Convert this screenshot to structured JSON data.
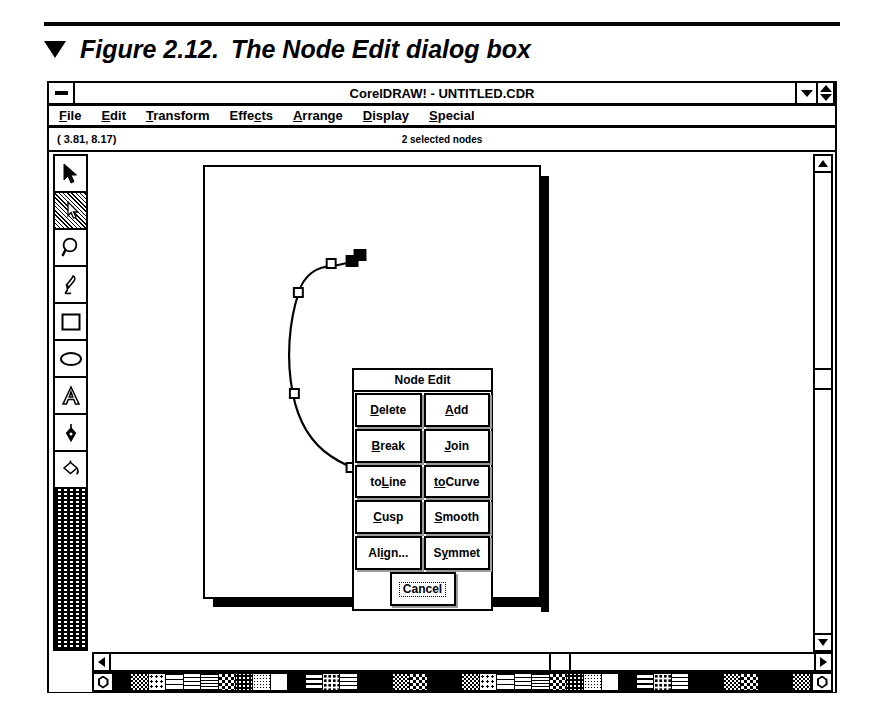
{
  "figure": {
    "marker": "▼",
    "number": "Figure 2.12.",
    "caption": "The Node Edit dialog box"
  },
  "window": {
    "title": "CorelDRAW! - UNTITLED.CDR",
    "system_menu_icon": "minimize-box-icon",
    "controls": [
      {
        "name": "minimize-button",
        "icon": "triangle-down-icon"
      },
      {
        "name": "maximize-button",
        "icon": "triangle-updown-icon"
      }
    ]
  },
  "menubar": {
    "items": [
      {
        "label": "File",
        "pre": "",
        "accel": "F",
        "post": "ile"
      },
      {
        "label": "Edit",
        "pre": "",
        "accel": "E",
        "post": "dit"
      },
      {
        "label": "Transform",
        "pre": "",
        "accel": "T",
        "post": "ransform"
      },
      {
        "label": "Effects",
        "pre": "Effe",
        "accel": "c",
        "post": "ts"
      },
      {
        "label": "Arrange",
        "pre": "",
        "accel": "A",
        "post": "rrange"
      },
      {
        "label": "Display",
        "pre": "",
        "accel": "D",
        "post": "isplay"
      },
      {
        "label": "Special",
        "pre": "",
        "accel": "S",
        "post": "pecial"
      }
    ]
  },
  "statusbar": {
    "coordinates": "( 3.81,  8.17)",
    "selection_info": "2 selected nodes"
  },
  "toolbox": {
    "tools": [
      {
        "name": "pick-tool",
        "icon": "arrow-pointer-icon",
        "selected": false
      },
      {
        "name": "shape-tool",
        "icon": "node-edit-arrow-icon",
        "selected": true
      },
      {
        "name": "zoom-tool",
        "icon": "magnifier-icon",
        "selected": false
      },
      {
        "name": "pencil-tool",
        "icon": "pencil-icon",
        "selected": false
      },
      {
        "name": "rectangle-tool",
        "icon": "rectangle-icon",
        "selected": false
      },
      {
        "name": "ellipse-tool",
        "icon": "ellipse-icon",
        "selected": false
      },
      {
        "name": "text-tool",
        "icon": "letter-a-icon",
        "selected": false
      },
      {
        "name": "outline-pen-tool",
        "icon": "pen-nib-icon",
        "selected": false
      },
      {
        "name": "fill-tool",
        "icon": "paint-bucket-icon",
        "selected": false
      }
    ]
  },
  "dialog": {
    "title": "Node Edit",
    "rows": [
      [
        {
          "name": "delete-button",
          "pre": "",
          "accel": "D",
          "post": "elete"
        },
        {
          "name": "add-button",
          "pre": "",
          "accel": "A",
          "post": "dd"
        }
      ],
      [
        {
          "name": "break-button",
          "pre": "",
          "accel": "B",
          "post": "reak"
        },
        {
          "name": "join-button",
          "pre": "",
          "accel": "J",
          "post": "oin"
        }
      ],
      [
        {
          "name": "toline-button",
          "pre": "to",
          "accel": "L",
          "post": "ine"
        },
        {
          "name": "tocurve-button",
          "pre": "",
          "accel": "to",
          "post": "Curve"
        }
      ],
      [
        {
          "name": "cusp-button",
          "pre": "",
          "accel": "C",
          "post": "usp"
        },
        {
          "name": "smooth-button",
          "pre": "",
          "accel": "S",
          "post": "mooth"
        }
      ],
      [
        {
          "name": "align-button",
          "pre": "Al",
          "accel": "i",
          "post": "gn..."
        },
        {
          "name": "symmet-button",
          "pre": "S",
          "accel": "y",
          "post": "mmet"
        }
      ]
    ],
    "cancel_label": "Cancel"
  },
  "scrollbars": {
    "vertical": {
      "up": "triangle-up-icon",
      "down": "triangle-down-icon"
    },
    "horizontal": {
      "left": "triangle-left-icon",
      "right": "triangle-right-icon"
    }
  },
  "palette": {
    "left_cap_icon": "hexagon-color-icon",
    "right_cap_icon": "hexagon-color-icon",
    "swatch_count": 40
  }
}
